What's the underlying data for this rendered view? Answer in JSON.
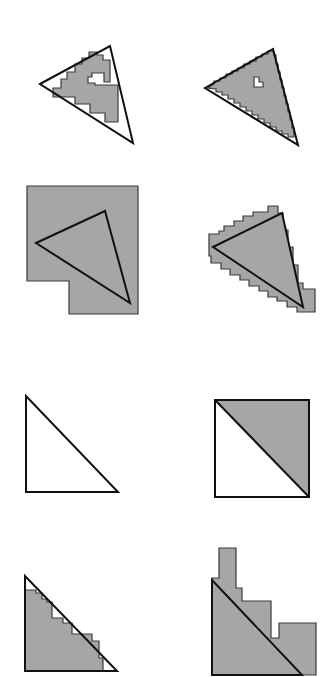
{
  "figure": {
    "width": 326,
    "height": 677,
    "colors": {
      "background": "#ffffff",
      "cell_fill": "#a6a6a6",
      "cell_stroke": "#3a3a3a",
      "triangle_stroke": "#111111"
    },
    "panels": [
      {
        "id": "row1-left",
        "description": "Triangle with inner cell approximation (interior cells only)",
        "shape_points": "53,97 53,88 61,88 61,79 67,79 67,72 75,72 75,64 82,64 82,58 89,58 89,52 97,52 97,55 103,55 103,60 110,60 110,82 104,82 104,73 92,73 92,77 88,77 88,83 95,83 95,85 118,85 118,122 105,122 105,113 90,113 90,104 75,104 75,97",
        "triangle_points": "40,84 110,46 133,143"
      },
      {
        "id": "row1-right",
        "description": "Triangle with inner cell approximation including a hole",
        "shape_points": "208,88 214,84 214,81 220,81 220,78 226,78 226,74 232,74 232,71 238,71 238,68 244,68 244,64 250,64 250,61 256,61 256,57 262,57 262,54 268,54 268,51 273,51 274,55 276,55 276,64 278,64 278,72 280,72 280,80 282,80 282,88 284,88 284,96 286,96 286,104 288,104 288,112 290,112 290,120 292,120 292,128 294,128 294,137 288,137 288,134 282,134 282,131 276,131 276,127 270,127 270,123 264,123 264,119 258,119 258,115 252,115 252,111 246,111 246,107 240,107 240,103 234,103 234,99 228,99 228,95 222,95 222,92 216,92 216,89",
        "hole_points": "254,77 254,87 263,87 263,82 259,82 259,77",
        "triangle_points": "205,88 273,49 298,145"
      },
      {
        "id": "row2-left",
        "description": "Triangle with single coarse cell bounding region",
        "shape_points": "27,186 138,186 138,314 69,314 69,281 27,281",
        "triangle_points": "36,243 105,211 130,303"
      },
      {
        "id": "row2-right",
        "description": "Triangle with outer cell approximation (all touching cells)",
        "shape_points": "209,240 209,234 219,234 219,231 224,231 224,226 234,226 234,221 243,221 243,216 253,216 253,212 268,212 268,206 278,206 278,213 283,213 283,230 288,230 288,247 293,247 293,265 298,265 298,283 303,283 303,289 315,289 315,312 297,312 297,307 287,307 287,301 277,301 277,297 268,297 268,291 259,291 259,286 249,286 249,280 240,280 240,275 230,275 230,269 221,269 221,263 211,263 211,256 209,256 209,253 209,253",
        "triangle_points": "213,247 282,213 303,307"
      },
      {
        "id": "row3-left",
        "description": "Axis-aligned right triangle, unfilled",
        "triangle_points": "26,396 26,492 118,492"
      },
      {
        "id": "row3-right",
        "description": "Square split along diagonal, upper-right half filled",
        "square_points": "215,400 309,400 309,497 215,497",
        "filled_points": "215,400 309,400 309,497",
        "diagonal": "215,400 309,497"
      },
      {
        "id": "row4-left",
        "description": "Right triangle with inner staircase approximation",
        "shape_points": "25,590 36,590 36,593 42,593 42,599 47,599 47,602 52,602 52,618 63,618 63,623 72,623 72,634 92,634 92,641 99,641 99,658 103,658 103,671 25,671",
        "triangle_points": "25,576 25,671 117,671"
      },
      {
        "id": "row4-right",
        "description": "Right triangle with outer staircase approximation",
        "shape_points": "212,583 212,578 219,578 219,548 236,548 236,588 242,588 242,601 271,601 271,638 279,638 279,623 316,623 316,675 212,675",
        "triangle_points": "212,580 212,675 302,675"
      }
    ]
  }
}
